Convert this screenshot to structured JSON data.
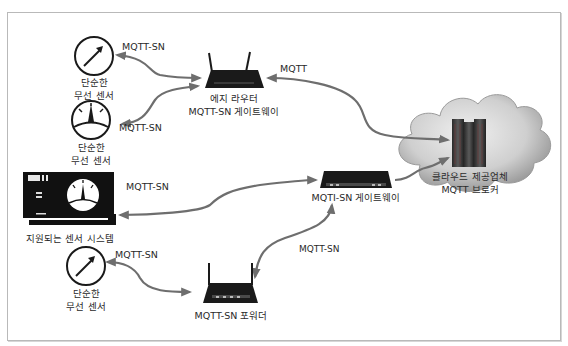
{
  "diagram": {
    "nodes": {
      "sensor1": {
        "line1": "단순한",
        "line2": "무선 센서",
        "icon": "gauge-arrow-icon"
      },
      "sensor2": {
        "line1": "단순한",
        "line2": "무선 센서",
        "icon": "gauge-dial-icon"
      },
      "sensor3": {
        "line1": "단순한",
        "line2": "무선 센서",
        "icon": "gauge-arrow-icon"
      },
      "sensor_system": {
        "label": "지원되는 센서 시스템",
        "icon": "sensor-system-panel-icon"
      },
      "edge_router": {
        "line1": "에지 라우터",
        "line2": "MQTT-SN 게이트웨이",
        "icon": "wireless-router-icon"
      },
      "gateway": {
        "label": "MQTI-SN 게이트웨이",
        "icon": "network-box-icon"
      },
      "forwarder": {
        "label": "MQTT-SN 포워더",
        "icon": "wireless-router-icon"
      },
      "broker": {
        "line1": "클라우드 제공업체",
        "line2": "MQTT 브로커",
        "icon": "cloud-server-icon"
      }
    },
    "edges": [
      {
        "from": "sensor1",
        "to": "edge_router",
        "label": "MQTT-SN"
      },
      {
        "from": "sensor2",
        "to": "edge_router",
        "label": "MQTT-SN"
      },
      {
        "from": "edge_router",
        "to": "broker",
        "label": "MQTT"
      },
      {
        "from": "sensor_system",
        "to": "gateway",
        "label": "MQTT-SN"
      },
      {
        "from": "gateway",
        "to": "broker",
        "label": ""
      },
      {
        "from": "sensor3",
        "to": "forwarder",
        "label": "MQTT-SN"
      },
      {
        "from": "forwarder",
        "to": "gateway",
        "label": "MQTT-SN"
      }
    ],
    "colors": {
      "arrow": "#6e6e6e",
      "device": "#1a1a1a",
      "cloud_light": "#e4e4e4",
      "cloud_dark": "#8a8a8a",
      "frame": "#b9b9b9"
    }
  }
}
